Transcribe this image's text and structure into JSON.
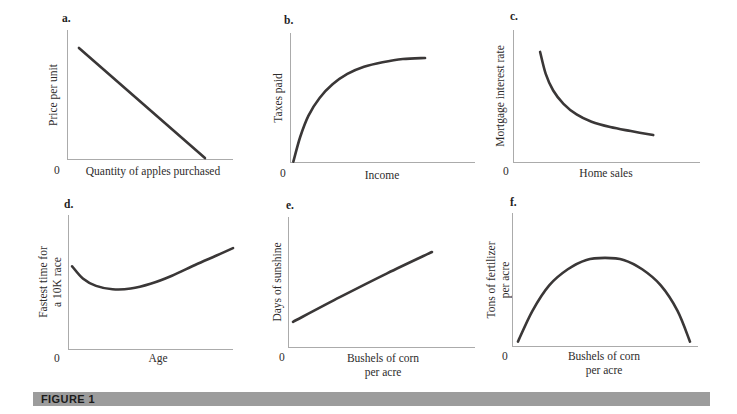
{
  "figure_label": "FIGURE 1",
  "colors": {
    "curve": "#3a3737",
    "axis": "#ababab",
    "bar_background": "#9c9c9c",
    "bar_text": "#1b1b1b",
    "label_text": "#2e2c2c"
  },
  "chart_data": [
    {
      "id": "a",
      "type": "line",
      "letter": "a.",
      "ylabel": "Price per unit",
      "xlabel": "Quantity of apples purchased",
      "origin": "0",
      "relationship": "negative linear (downward-sloping straight line)",
      "axes_labeled_values": "none (only 0 at origin)",
      "points": [
        [
          0.072,
          0.138
        ],
        [
          0.831,
          0.985
        ]
      ]
    },
    {
      "id": "b",
      "type": "line",
      "letter": "b.",
      "ylabel": "Taxes paid",
      "xlabel": "Income",
      "origin": "0",
      "relationship": "increasing at a decreasing rate (concave, saturating)",
      "axes_labeled_values": "none (only 0 at origin)",
      "points": [
        [
          0.018,
          0.99
        ],
        [
          0.055,
          0.8
        ],
        [
          0.1,
          0.635
        ],
        [
          0.16,
          0.5
        ],
        [
          0.23,
          0.395
        ],
        [
          0.31,
          0.315
        ],
        [
          0.4,
          0.26
        ],
        [
          0.5,
          0.225
        ],
        [
          0.61,
          0.2
        ],
        [
          0.73,
          0.192
        ]
      ]
    },
    {
      "id": "c",
      "type": "line",
      "letter": "c.",
      "ylabel": "Mortgage interest rate",
      "xlabel": "Home sales",
      "origin": "0",
      "relationship": "negative, decreasing at a decreasing rate (convex hyperbola-like)",
      "axes_labeled_values": "none (only 0 at origin)",
      "points": [
        [
          0.145,
          0.165
        ],
        [
          0.175,
          0.33
        ],
        [
          0.215,
          0.455
        ],
        [
          0.27,
          0.555
        ],
        [
          0.34,
          0.635
        ],
        [
          0.42,
          0.69
        ],
        [
          0.52,
          0.73
        ],
        [
          0.63,
          0.76
        ],
        [
          0.75,
          0.79
        ]
      ]
    },
    {
      "id": "d",
      "type": "line",
      "letter": "d.",
      "ylabel": "Fastest time for\na 10K race",
      "xlabel": "Age",
      "origin": "0",
      "relationship": "U-shaped: decreases then increases with age",
      "axes_labeled_values": "none (only 0 at origin)",
      "points": [
        [
          0.025,
          0.38
        ],
        [
          0.09,
          0.47
        ],
        [
          0.17,
          0.525
        ],
        [
          0.27,
          0.55
        ],
        [
          0.38,
          0.545
        ],
        [
          0.5,
          0.51
        ],
        [
          0.63,
          0.45
        ],
        [
          0.77,
          0.37
        ],
        [
          0.9,
          0.3
        ],
        [
          1.0,
          0.245
        ]
      ]
    },
    {
      "id": "e",
      "type": "line",
      "letter": "e.",
      "ylabel": "Days of sunshine",
      "xlabel": "Bushels of corn\nper acre",
      "origin": "0",
      "relationship": "positive, roughly linear upward-sloping",
      "axes_labeled_values": "none (only 0 at origin)",
      "points": [
        [
          0.027,
          0.8
        ],
        [
          0.28,
          0.61
        ],
        [
          0.53,
          0.43
        ],
        [
          0.77,
          0.267
        ]
      ]
    },
    {
      "id": "f",
      "type": "line",
      "letter": "f.",
      "ylabel": "Tons of fertilizer\nper acre",
      "xlabel": "Bushels of corn\nper acre",
      "origin": "0",
      "relationship": "inverted U: increases, peaks, then decreases",
      "axes_labeled_values": "none (only 0 at origin)",
      "points": [
        [
          0.032,
          0.96
        ],
        [
          0.11,
          0.73
        ],
        [
          0.2,
          0.54
        ],
        [
          0.3,
          0.42
        ],
        [
          0.4,
          0.35
        ],
        [
          0.5,
          0.335
        ],
        [
          0.6,
          0.35
        ],
        [
          0.7,
          0.42
        ],
        [
          0.8,
          0.54
        ],
        [
          0.89,
          0.73
        ],
        [
          0.957,
          0.96
        ]
      ]
    }
  ]
}
